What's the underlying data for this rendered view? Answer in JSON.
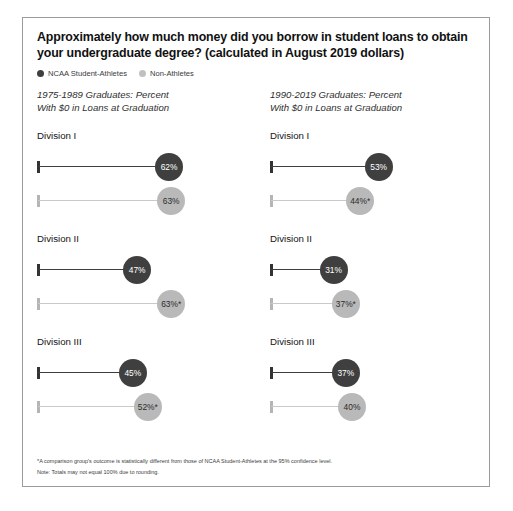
{
  "chart_data": {
    "type": "bar",
    "title": "Approximately how much money did you borrow in student loans to obtain your undergraduate degree? (calculated in August 2019 dollars)",
    "xlabel": "",
    "ylabel": "Percent With $0 in Loans at Graduation",
    "xlim": [
      0,
      100
    ],
    "grid": false,
    "legend_position": "top-left",
    "legend": [
      {
        "name": "NCAA Student-Athletes",
        "color": "#3f3f3f"
      },
      {
        "name": "Non-Athletes",
        "color": "#b9b9b9"
      }
    ],
    "categories": [
      "Division I",
      "Division II",
      "Division III"
    ],
    "panels": [
      {
        "header_line1": "1975-1989 Graduates: Percent",
        "header_line2": "With $0 in Loans at Graduation",
        "groups": [
          {
            "label": "Division I",
            "bars": [
              {
                "series": "NCAA Student-Athletes",
                "value": 62,
                "label": "62%",
                "significant": false
              },
              {
                "series": "Non-Athletes",
                "value": 63,
                "label": "63%",
                "significant": false
              }
            ]
          },
          {
            "label": "Division II",
            "bars": [
              {
                "series": "NCAA Student-Athletes",
                "value": 47,
                "label": "47%",
                "significant": false
              },
              {
                "series": "Non-Athletes",
                "value": 63,
                "label": "63%*",
                "significant": true
              }
            ]
          },
          {
            "label": "Division III",
            "bars": [
              {
                "series": "NCAA Student-Athletes",
                "value": 45,
                "label": "45%",
                "significant": false
              },
              {
                "series": "Non-Athletes",
                "value": 52,
                "label": "52%*",
                "significant": true
              }
            ]
          }
        ]
      },
      {
        "header_line1": "1990-2019 Graduates: Percent",
        "header_line2": "With $0 in Loans at Graduation",
        "groups": [
          {
            "label": "Division I",
            "bars": [
              {
                "series": "NCAA Student-Athletes",
                "value": 53,
                "label": "53%",
                "significant": false
              },
              {
                "series": "Non-Athletes",
                "value": 44,
                "label": "44%*",
                "significant": true
              }
            ]
          },
          {
            "label": "Division II",
            "bars": [
              {
                "series": "NCAA Student-Athletes",
                "value": 31,
                "label": "31%",
                "significant": false
              },
              {
                "series": "Non-Athletes",
                "value": 37,
                "label": "37%*",
                "significant": true
              }
            ]
          },
          {
            "label": "Division III",
            "bars": [
              {
                "series": "NCAA Student-Athletes",
                "value": 37,
                "label": "37%",
                "significant": false
              },
              {
                "series": "Non-Athletes",
                "value": 40,
                "label": "40%",
                "significant": false
              }
            ]
          }
        ]
      }
    ],
    "annotations": [
      "*A comparison group's outcome is statistically different from those of NCAA Student-Athletes at the 95% confidence level.",
      "Note: Totals may not equal 100% due to rounding."
    ]
  }
}
